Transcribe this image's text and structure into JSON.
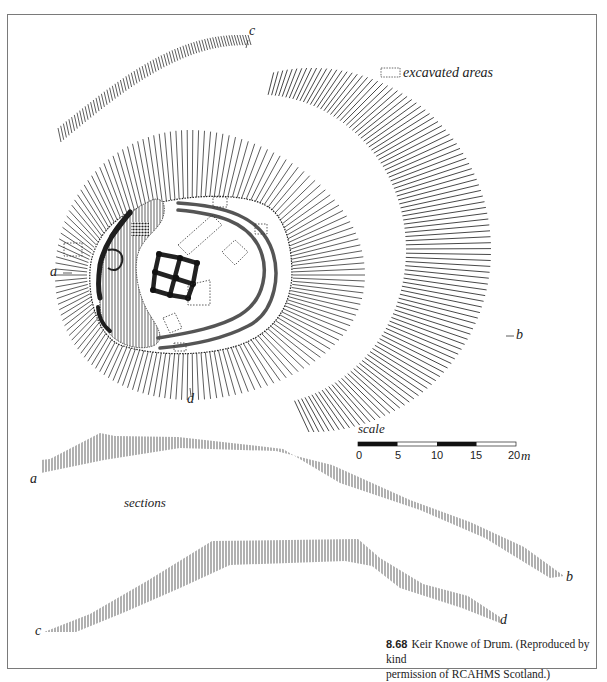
{
  "figure": {
    "number": "8.68",
    "caption": "Keir Knowe of Drum. (Reproduced by kind permission of RCAHMS Scotland.)",
    "caption_title": "Keir Knowe of Drum. (Reproduced by kind",
    "caption_line2": "permission of RCAHMS Scotland.)"
  },
  "legend": {
    "excavated_label": "excavated areas",
    "excavated_symbol": "dotted-rectangle"
  },
  "plan": {
    "section_markers": {
      "a": "a",
      "b": "b",
      "c": "c",
      "d": "d"
    }
  },
  "scale": {
    "label": "scale",
    "ticks": [
      "0",
      "5",
      "10",
      "15",
      "20"
    ],
    "unit": "m",
    "segments": [
      "filled",
      "empty",
      "filled",
      "empty"
    ]
  },
  "sections": {
    "label": "sections",
    "profile_ab": {
      "start": "a",
      "end": "b"
    },
    "profile_cd": {
      "start": "c",
      "end": "d"
    }
  },
  "colors": {
    "line": "#333333",
    "hatch": "#8a8a8a",
    "ditch": "#555555",
    "frame": "#7a7a7a"
  }
}
